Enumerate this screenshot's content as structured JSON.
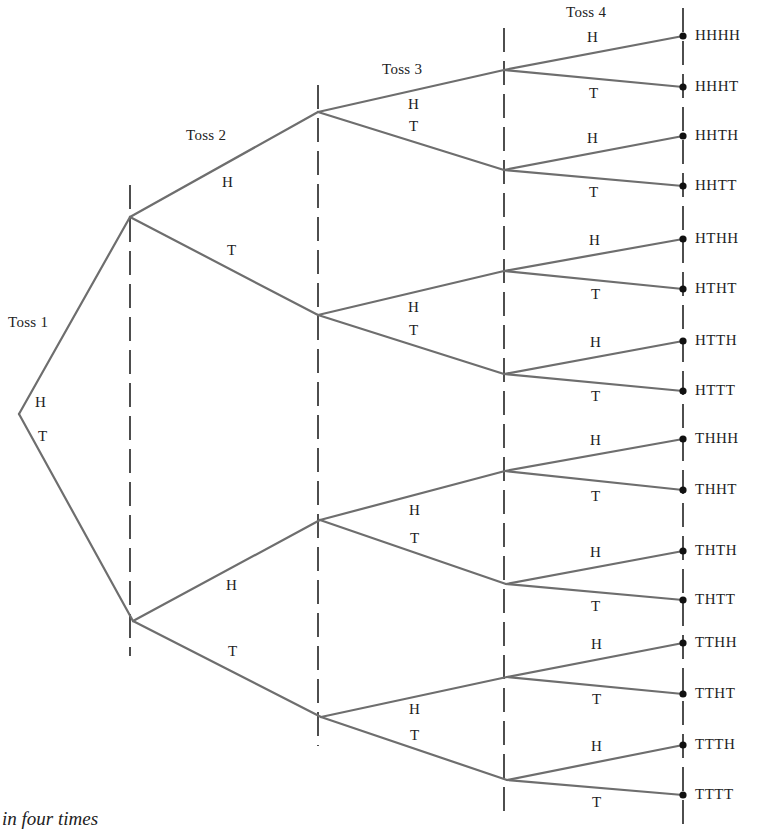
{
  "diagram": {
    "type": "tree",
    "colors": {
      "branch": "#6e6e6e",
      "divider": "#222222",
      "leaf_dot": "#111111",
      "text": "#222222"
    },
    "stages": [
      {
        "label": "Toss 1",
        "x": 8,
        "y": 315
      },
      {
        "label": "Toss 2",
        "x": 186,
        "y": 128
      },
      {
        "label": "Toss 3",
        "x": 382,
        "y": 62
      },
      {
        "label": "Toss 4",
        "x": 566,
        "y": 5
      }
    ],
    "dividers_x": [
      {
        "x": 130,
        "y1": 185,
        "y2": 656
      },
      {
        "x": 318,
        "y1": 85,
        "y2": 746
      },
      {
        "x": 504,
        "y1": 28,
        "y2": 815
      },
      {
        "x": 683,
        "y1": 8,
        "y2": 826
      }
    ],
    "root": {
      "x": 19,
      "y": 414
    },
    "nodes": {
      "H": {
        "x": 130,
        "y": 217
      },
      "T": {
        "x": 133,
        "y": 621
      },
      "HH": {
        "x": 318,
        "y": 112
      },
      "HT": {
        "x": 318,
        "y": 315
      },
      "TH": {
        "x": 320,
        "y": 520
      },
      "TT": {
        "x": 321,
        "y": 717
      },
      "HHH": {
        "x": 504,
        "y": 70
      },
      "HHT": {
        "x": 504,
        "y": 170
      },
      "HTH": {
        "x": 504,
        "y": 271
      },
      "HTT": {
        "x": 504,
        "y": 374
      },
      "THH": {
        "x": 505,
        "y": 471
      },
      "THT": {
        "x": 506,
        "y": 584
      },
      "TTH": {
        "x": 507,
        "y": 677
      },
      "TTT": {
        "x": 507,
        "y": 780
      }
    },
    "outcomes": [
      {
        "label": "HHHH",
        "y": 36
      },
      {
        "label": "HHHT",
        "y": 87
      },
      {
        "label": "HHTH",
        "y": 136
      },
      {
        "label": "HHTT",
        "y": 186
      },
      {
        "label": "HTHH",
        "y": 239
      },
      {
        "label": "HTHT",
        "y": 289
      },
      {
        "label": "HTTH",
        "y": 341
      },
      {
        "label": "HTTT",
        "y": 391
      },
      {
        "label": "THHH",
        "y": 439
      },
      {
        "label": "THHT",
        "y": 490
      },
      {
        "label": "THTH",
        "y": 551
      },
      {
        "label": "THTT",
        "y": 600
      },
      {
        "label": "TTHH",
        "y": 643
      },
      {
        "label": "TTHT",
        "y": 694
      },
      {
        "label": "TTTH",
        "y": 745
      },
      {
        "label": "TTTT",
        "y": 795
      }
    ],
    "leaf_x": 683,
    "branch_labels": [
      {
        "text": "H",
        "x": 35,
        "y": 395
      },
      {
        "text": "T",
        "x": 38,
        "y": 429
      },
      {
        "text": "H",
        "x": 222,
        "y": 175
      },
      {
        "text": "T",
        "x": 227,
        "y": 243
      },
      {
        "text": "H",
        "x": 226,
        "y": 578
      },
      {
        "text": "T",
        "x": 228,
        "y": 644
      },
      {
        "text": "H",
        "x": 408,
        "y": 97
      },
      {
        "text": "T",
        "x": 409,
        "y": 119
      },
      {
        "text": "H",
        "x": 408,
        "y": 300
      },
      {
        "text": "T",
        "x": 409,
        "y": 323
      },
      {
        "text": "H",
        "x": 409,
        "y": 503
      },
      {
        "text": "T",
        "x": 410,
        "y": 531
      },
      {
        "text": "H",
        "x": 409,
        "y": 702
      },
      {
        "text": "T",
        "x": 410,
        "y": 728
      },
      {
        "text": "H",
        "x": 587,
        "y": 30
      },
      {
        "text": "T",
        "x": 589,
        "y": 86
      },
      {
        "text": "H",
        "x": 587,
        "y": 131
      },
      {
        "text": "T",
        "x": 589,
        "y": 185
      },
      {
        "text": "H",
        "x": 589,
        "y": 233
      },
      {
        "text": "T",
        "x": 591,
        "y": 287
      },
      {
        "text": "H",
        "x": 590,
        "y": 335
      },
      {
        "text": "T",
        "x": 591,
        "y": 389
      },
      {
        "text": "H",
        "x": 590,
        "y": 433
      },
      {
        "text": "T",
        "x": 591,
        "y": 489
      },
      {
        "text": "H",
        "x": 590,
        "y": 545
      },
      {
        "text": "T",
        "x": 591,
        "y": 599
      },
      {
        "text": "H",
        "x": 591,
        "y": 637
      },
      {
        "text": "T",
        "x": 592,
        "y": 692
      },
      {
        "text": "H",
        "x": 591,
        "y": 739
      },
      {
        "text": "T",
        "x": 592,
        "y": 795
      }
    ]
  },
  "caption": "in four times"
}
